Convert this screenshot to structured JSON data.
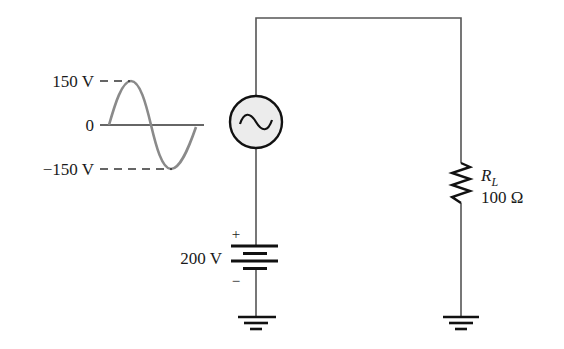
{
  "waveform": {
    "peak_label": "150 V",
    "zero_label": "0",
    "trough_label": "−150 V",
    "color": "#8a8a8a"
  },
  "ac_source": {
    "symbol": "~",
    "fill": "#ececec"
  },
  "battery": {
    "voltage_label": "200 V",
    "plus": "+",
    "minus": "−"
  },
  "resistor": {
    "name_main": "R",
    "name_sub": "L",
    "value_label": "100 Ω"
  },
  "grounds": [
    "source-ground",
    "load-ground"
  ]
}
